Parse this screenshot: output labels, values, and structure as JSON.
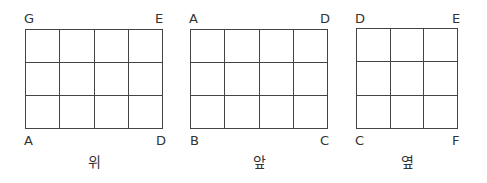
{
  "views": [
    {
      "caption": "위",
      "cols": 4,
      "rows": 3,
      "corners": {
        "top_left": "G",
        "top_right": "E",
        "bottom_left": "A",
        "bottom_right": "D"
      }
    },
    {
      "caption": "앞",
      "cols": 4,
      "rows": 3,
      "corners": {
        "top_left": "A",
        "top_right": "D",
        "bottom_left": "B",
        "bottom_right": "C"
      }
    },
    {
      "caption": "옆",
      "cols": 3,
      "rows": 3,
      "corners": {
        "top_left": "D",
        "top_right": "E",
        "bottom_left": "C",
        "bottom_right": "F"
      }
    }
  ]
}
